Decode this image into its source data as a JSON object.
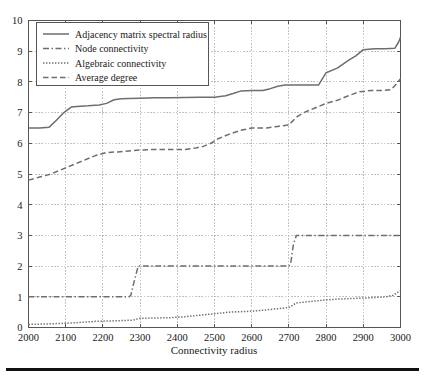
{
  "chart_data": {
    "type": "line",
    "title": "",
    "xlabel": "Connectivity radius",
    "ylabel": "",
    "xlim": [
      2000,
      3000
    ],
    "ylim": [
      0,
      10
    ],
    "xticks": [
      2000,
      2100,
      2200,
      2300,
      2400,
      2500,
      2600,
      2700,
      2800,
      2900,
      3000
    ],
    "yticks": [
      0,
      1,
      2,
      3,
      4,
      5,
      6,
      7,
      8,
      9,
      10
    ],
    "xtick_labels": [
      "2000",
      "2100",
      "2200",
      "2300",
      "2400",
      "2500",
      "2600",
      "2700",
      "2800",
      "2900",
      "3000"
    ],
    "ytick_labels": [
      "0",
      "1",
      "2",
      "3",
      "4",
      "5",
      "6",
      "7",
      "8",
      "9",
      "10"
    ],
    "grid": true,
    "grid_style": "dotted",
    "legend_position": "upper-left",
    "line_color": "#6e6e6e",
    "series": [
      {
        "name": "Adjacency matrix spectral radius",
        "style": "solid",
        "dash": "none",
        "x": [
          2000,
          2030,
          2055,
          2075,
          2095,
          2115,
          2130,
          2160,
          2190,
          2210,
          2230,
          2250,
          2270,
          2300,
          2340,
          2380,
          2420,
          2460,
          2500,
          2530,
          2550,
          2570,
          2600,
          2630,
          2650,
          2670,
          2690,
          2700,
          2710,
          2730,
          2750,
          2780,
          2800,
          2830,
          2860,
          2880,
          2900,
          2930,
          2960,
          2985,
          2995,
          3000
        ],
        "y": [
          6.5,
          6.5,
          6.52,
          6.75,
          7.0,
          7.18,
          7.2,
          7.22,
          7.25,
          7.3,
          7.42,
          7.45,
          7.46,
          7.47,
          7.48,
          7.48,
          7.49,
          7.5,
          7.5,
          7.55,
          7.62,
          7.7,
          7.72,
          7.72,
          7.78,
          7.86,
          7.9,
          7.9,
          7.9,
          7.9,
          7.9,
          7.9,
          8.3,
          8.45,
          8.7,
          8.85,
          9.05,
          9.08,
          9.08,
          9.1,
          9.3,
          9.45
        ]
      },
      {
        "name": "Node connectivity",
        "style": "dash-dot",
        "dash": "6 2.5 1.5 2.5",
        "x": [
          2000,
          2270,
          2275,
          2285,
          2295,
          2700,
          2705,
          2712,
          2720,
          3000
        ],
        "y": [
          1,
          1,
          1.05,
          1.55,
          2,
          2,
          2.1,
          2.7,
          3,
          3
        ]
      },
      {
        "name": "Algebraic connectivity",
        "style": "dotted",
        "dash": "1.4 1.6",
        "x": [
          2000,
          2060,
          2120,
          2180,
          2240,
          2280,
          2300,
          2340,
          2380,
          2420,
          2460,
          2500,
          2540,
          2580,
          2620,
          2660,
          2700,
          2720,
          2760,
          2800,
          2840,
          2880,
          2920,
          2960,
          2980,
          3000
        ],
        "y": [
          0.1,
          0.12,
          0.15,
          0.2,
          0.22,
          0.24,
          0.3,
          0.31,
          0.32,
          0.35,
          0.4,
          0.45,
          0.5,
          0.52,
          0.55,
          0.6,
          0.65,
          0.8,
          0.85,
          0.9,
          0.93,
          0.95,
          0.97,
          1.0,
          1.05,
          1.2
        ]
      },
      {
        "name": "Average degree",
        "style": "dashed",
        "dash": "5.5 3",
        "x": [
          2000,
          2030,
          2060,
          2090,
          2120,
          2150,
          2180,
          2210,
          2240,
          2270,
          2300,
          2340,
          2380,
          2420,
          2450,
          2470,
          2490,
          2510,
          2540,
          2570,
          2600,
          2640,
          2670,
          2700,
          2720,
          2740,
          2770,
          2800,
          2830,
          2860,
          2890,
          2920,
          2950,
          2975,
          2990,
          3000
        ],
        "y": [
          4.8,
          4.9,
          5.0,
          5.15,
          5.3,
          5.45,
          5.6,
          5.7,
          5.72,
          5.75,
          5.78,
          5.8,
          5.8,
          5.8,
          5.85,
          5.9,
          6.0,
          6.15,
          6.3,
          6.42,
          6.5,
          6.5,
          6.55,
          6.6,
          6.85,
          7.0,
          7.15,
          7.3,
          7.4,
          7.55,
          7.68,
          7.72,
          7.72,
          7.75,
          7.95,
          8.1
        ]
      }
    ]
  },
  "legend": {
    "entries": [
      {
        "label": "Adjacency matrix spectral radius"
      },
      {
        "label": "Node connectivity"
      },
      {
        "label": "Algebraic connectivity"
      },
      {
        "label": "Average degree"
      }
    ]
  }
}
